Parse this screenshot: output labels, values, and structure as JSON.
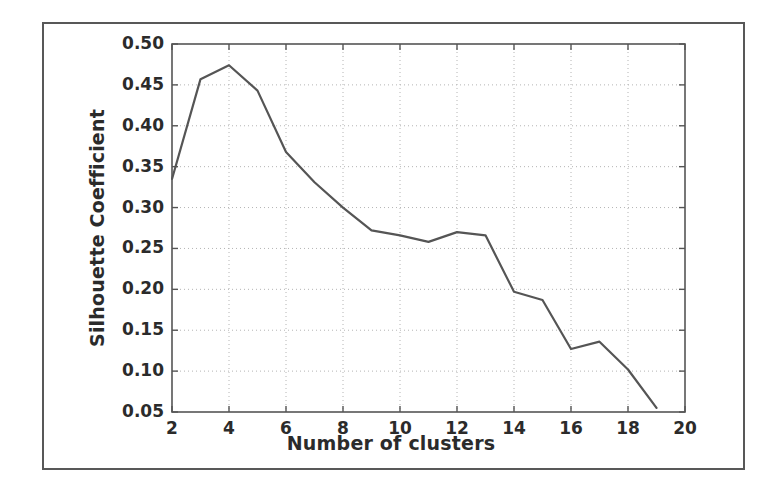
{
  "figure": {
    "frame_color": "#585858",
    "background": "#ffffff"
  },
  "chart_data": {
    "type": "line",
    "title": "",
    "xlabel": "Number of clusters",
    "ylabel": "Silhouette Coefficient",
    "xlim": [
      2,
      20
    ],
    "ylim": [
      0.05,
      0.5
    ],
    "grid": true,
    "grid_style": "dotted",
    "grid_color": "#b4b4b4",
    "legend": null,
    "line_color": "#555555",
    "line_width": 2.2,
    "xticks": [
      2,
      4,
      6,
      8,
      10,
      12,
      14,
      16,
      18,
      20
    ],
    "xtick_labels": [
      "2",
      "4",
      "6",
      "8",
      "10",
      "12",
      "14",
      "16",
      "18",
      "20"
    ],
    "yticks": [
      0.05,
      0.1,
      0.15,
      0.2,
      0.25,
      0.3,
      0.35,
      0.4,
      0.45,
      0.5
    ],
    "ytick_labels": [
      "0.05",
      "0.10",
      "0.15",
      "0.20",
      "0.25",
      "0.30",
      "0.35",
      "0.40",
      "0.45",
      "0.50"
    ],
    "x": [
      2,
      3,
      4,
      5,
      6,
      7,
      8,
      9,
      10,
      11,
      12,
      13,
      14,
      15,
      16,
      17,
      18,
      19
    ],
    "values": [
      0.335,
      0.457,
      0.474,
      0.443,
      0.368,
      0.331,
      0.3,
      0.272,
      0.266,
      0.258,
      0.27,
      0.266,
      0.197,
      0.187,
      0.127,
      0.136,
      0.102,
      0.055
    ],
    "series": [
      {
        "name": "Silhouette Coefficient",
        "values": [
          0.335,
          0.457,
          0.474,
          0.443,
          0.368,
          0.331,
          0.3,
          0.272,
          0.266,
          0.258,
          0.27,
          0.266,
          0.197,
          0.187,
          0.127,
          0.136,
          0.102,
          0.055
        ]
      }
    ]
  }
}
